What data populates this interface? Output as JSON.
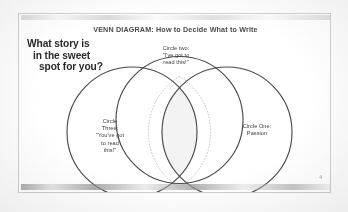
{
  "slide": {
    "title": "VENN DIAGRAM: How to Decide What to Write",
    "page_number": "4",
    "question": {
      "line1": "What story is",
      "line2": "in the sweet",
      "line3": "spot for you?"
    },
    "background_color": "#ffffff",
    "border_color": "#cfcfcf",
    "stroke_color": "#3a3a3a",
    "intersection_fill": "#f2f2f2"
  },
  "venn": {
    "circles": [
      {
        "id": "circle-two",
        "name": "Circle Two",
        "label_lines": [
          "Circle two:",
          "\"I've got to",
          "read this!\""
        ],
        "position": "top"
      },
      {
        "id": "circle-three",
        "name": "Circle Three",
        "label_lines": [
          "Circle",
          "Three:",
          "\"You've got",
          "to read",
          "this!\""
        ],
        "position": "left"
      },
      {
        "id": "circle-one",
        "name": "Circle One",
        "label_lines": [
          "Circle One:",
          "Passion"
        ],
        "position": "right"
      }
    ],
    "intersection": {
      "name": "sweet-spot",
      "shape": "lens",
      "outline": "dashed"
    }
  }
}
